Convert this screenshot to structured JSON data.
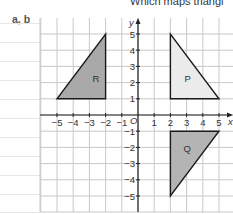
{
  "heading": "Which maps triangl",
  "part_label": "a, b",
  "axes": {
    "x_label": "x",
    "y_label": "y",
    "origin_label": "O",
    "x_ticks": [
      "-5",
      "-4",
      "-3",
      "-2",
      "-1",
      "1",
      "2",
      "3",
      "4",
      "5"
    ],
    "y_ticks": [
      "5",
      "4",
      "3",
      "2",
      "1",
      "-1",
      "-2",
      "-3",
      "-4",
      "-5"
    ],
    "range": {
      "x": [
        -5,
        5
      ],
      "y": [
        -5,
        5
      ]
    }
  },
  "shapes": [
    {
      "label": "R",
      "vertices": [
        [
          -5,
          1
        ],
        [
          -2,
          1
        ],
        [
          -2,
          5
        ]
      ],
      "fill": "#a9a9a9"
    },
    {
      "label": "P",
      "vertices": [
        [
          2,
          5
        ],
        [
          2,
          1
        ],
        [
          5,
          1
        ]
      ],
      "fill": "#ebebeb"
    },
    {
      "label": "Q",
      "vertices": [
        [
          2,
          -1
        ],
        [
          5,
          -1
        ],
        [
          2,
          -5
        ]
      ],
      "fill": "#b4b4b4"
    }
  ],
  "colors": {
    "grid": "#c8c8c8",
    "axis": "#222222",
    "outline": "#1a1a1a",
    "margin_rule": "#e6e6e6"
  }
}
